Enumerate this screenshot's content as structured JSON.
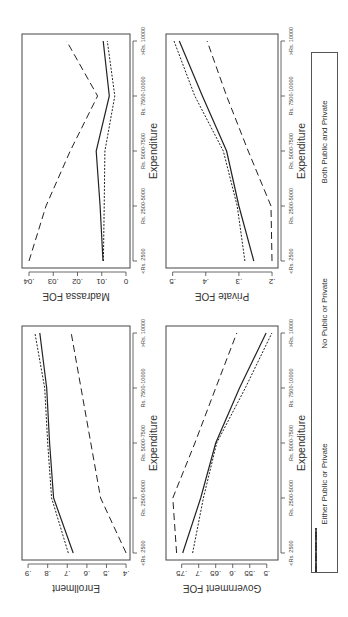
{
  "figure": {
    "x_categories": [
      "<Rs. 2500",
      "Rs. 2500-5000",
      "Rs. 5000-7500",
      "Rs. 7500-10000",
      ">Rs. 10000"
    ],
    "xlabel": "Expenditure",
    "orientation": "rotated 90 degrees counter-clockwise"
  },
  "legend": {
    "items": [
      {
        "label": "Either Public or Private",
        "style": "solid"
      },
      {
        "label": "No Public or Private",
        "style": "longdash"
      },
      {
        "label": "Both Public and Private",
        "style": "dotted"
      }
    ]
  },
  "chart_data": [
    {
      "type": "line",
      "title": "",
      "xlabel": "Expenditure",
      "ylabel": "Enrollment",
      "categories": [
        "<Rs. 2500",
        "Rs. 2500-5000",
        "Rs. 5000-7500",
        "Rs. 7500-10000",
        ">Rs. 10000"
      ],
      "yticks": [
        ".4",
        ".5",
        ".6",
        ".7",
        ".8",
        ".9"
      ],
      "ytick_values": [
        0.4,
        0.5,
        0.6,
        0.7,
        0.8,
        0.9
      ],
      "ylim": [
        0.38,
        0.931
      ],
      "grid": false,
      "panel": {
        "x": 57,
        "y": 22,
        "w": 234,
        "h": 108
      },
      "series": [
        {
          "name": "Either Public or Private",
          "style": "solid",
          "values": [
            0.67,
            0.77,
            0.79,
            0.805,
            0.84
          ]
        },
        {
          "name": "No Public or Private",
          "style": "longdash",
          "values": [
            0.4,
            0.53,
            0.58,
            0.63,
            0.68
          ]
        },
        {
          "name": "Both Public and Private",
          "style": "dotted",
          "values": [
            0.695,
            0.78,
            0.8,
            0.815,
            0.865
          ]
        }
      ]
    },
    {
      "type": "line",
      "title": "",
      "xlabel": "Expenditure",
      "ylabel": "Government FOE",
      "categories": [
        "<Rs. 2500",
        "Rs. 2500-5000",
        "Rs. 5000-7500",
        "Rs. 7500-10000",
        ">Rs. 10000"
      ],
      "yticks": [
        ".5",
        ".55",
        ".6",
        ".65",
        ".7",
        ".75"
      ],
      "ytick_values": [
        0.5,
        0.55,
        0.6,
        0.65,
        0.7,
        0.75
      ],
      "ylim": [
        0.467,
        0.796
      ],
      "grid": false,
      "panel": {
        "x": 57,
        "y": 166,
        "w": 234,
        "h": 112
      },
      "series": [
        {
          "name": "Either Public or Private",
          "style": "solid",
          "values": [
            0.747,
            0.694,
            0.65,
            0.58,
            0.502
          ]
        },
        {
          "name": "No Public or Private",
          "style": "longdash",
          "values": [
            0.765,
            0.776,
            0.711,
            0.65,
            0.588
          ]
        },
        {
          "name": "Both Public and Private",
          "style": "dotted",
          "values": [
            0.718,
            0.686,
            0.647,
            0.563,
            0.485
          ]
        }
      ]
    },
    {
      "type": "line",
      "title": "",
      "xlabel": "Expenditure",
      "ylabel": "Madrassa FOE",
      "categories": [
        "<Rs. 2500",
        "Rs. 2500-5000",
        "Rs. 5000-7500",
        "Rs. 7500-10000",
        ">Rs. 10000"
      ],
      "yticks": [
        "0",
        ".01",
        ".02",
        ".03",
        ".04"
      ],
      "ytick_values": [
        0,
        0.01,
        0.02,
        0.03,
        0.04
      ],
      "ylim": [
        -0.00165,
        0.04289
      ],
      "grid": false,
      "panel": {
        "x": 349,
        "y": 22,
        "w": 234,
        "h": 108
      },
      "series": [
        {
          "name": "Either Public or Private",
          "style": "solid",
          "values": [
            0.0095,
            0.0107,
            0.0123,
            0.0069,
            0.0094
          ]
        },
        {
          "name": "No Public or Private",
          "style": "longdash",
          "values": [
            0.04,
            0.033,
            0.023,
            0.0117,
            0.0245
          ]
        },
        {
          "name": "Both Public and Private",
          "style": "dotted",
          "values": [
            0.0093,
            0.009,
            0.0087,
            0.0046,
            0.0077
          ]
        }
      ]
    },
    {
      "type": "line",
      "title": "",
      "xlabel": "Expenditure",
      "ylabel": "Private FOE",
      "categories": [
        "<Rs. 2500",
        "Rs. 2500-5000",
        "Rs. 5000-7500",
        "Rs. 7500-10000",
        ">Rs. 10000"
      ],
      "yticks": [
        ".2",
        ".3",
        ".4",
        ".5"
      ],
      "ytick_values": [
        0.2,
        0.3,
        0.4,
        0.5
      ],
      "ylim": [
        0.182,
        0.52
      ],
      "grid": false,
      "panel": {
        "x": 349,
        "y": 166,
        "w": 234,
        "h": 112
      },
      "series": [
        {
          "name": "Either Public or Private",
          "style": "solid",
          "values": [
            0.255,
            0.3,
            0.337,
            0.41,
            0.48
          ]
        },
        {
          "name": "No Public or Private",
          "style": "longdash",
          "values": [
            0.2,
            0.203,
            0.272,
            0.337,
            0.396
          ]
        },
        {
          "name": "Both Public and Private",
          "style": "dotted",
          "values": [
            0.282,
            0.305,
            0.347,
            0.433,
            0.496
          ]
        }
      ]
    }
  ]
}
